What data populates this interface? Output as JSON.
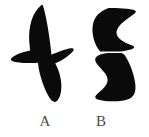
{
  "figure": {
    "background_color": "#ffffff",
    "ink_color": "#0a0a0a",
    "label_color": "#4a4a4a",
    "caption_font_size": 15,
    "width": 149,
    "height": 137
  },
  "shapes": [
    {
      "id": "shape-a",
      "label": "A",
      "description": "bird-silhouette",
      "fill": "#0a0a0a"
    },
    {
      "id": "shape-b",
      "label": "B",
      "description": "hourglass-silhouette",
      "fill": "#0a0a0a"
    }
  ],
  "labels": {
    "a": "A",
    "b": "B"
  }
}
